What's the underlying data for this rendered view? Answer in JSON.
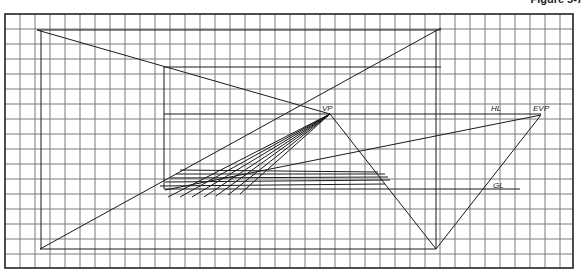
{
  "figure": {
    "label": "Figure 5-7"
  },
  "diagram": {
    "type": "two-point perspective construction on grid paper",
    "labels": {
      "vp": "VP",
      "hl": "HL",
      "evp": "EVP",
      "gl": "GL"
    },
    "grid": {
      "left": 5,
      "top": 14,
      "right": 573,
      "bottom": 268,
      "cell": 15,
      "color": "#555555"
    },
    "points": {
      "VP": [
        330,
        114
      ],
      "EVP": [
        541,
        115
      ],
      "bottom_apex": [
        436,
        249
      ]
    },
    "colors": {
      "ink": "#1a1a1a",
      "grid": "#6b6b6b",
      "border": "#222222"
    }
  }
}
